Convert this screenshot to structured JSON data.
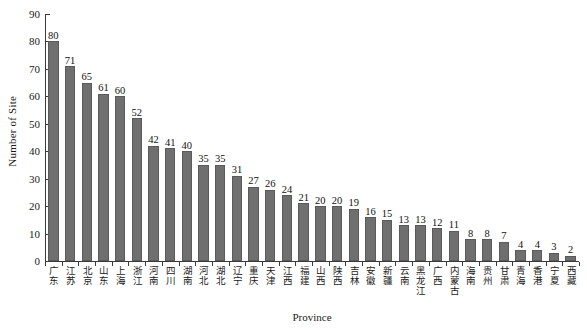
{
  "chart_data": {
    "type": "bar",
    "title": "",
    "xlabel": "Province",
    "ylabel": "Number of Site",
    "ylim": [
      0,
      90
    ],
    "ytick_step": 10,
    "yticks": [
      0,
      10,
      20,
      30,
      40,
      50,
      60,
      70,
      80,
      90
    ],
    "grid": false,
    "legend": null,
    "bar_color": "#6f6f6f",
    "bar_edge_color": "#5a5a5a",
    "axis_color": "#3a3a3a",
    "value_labels_shown": true,
    "categories": [
      "广东",
      "江苏",
      "北京",
      "山东",
      "上海",
      "浙江",
      "河南",
      "四川",
      "湖南",
      "河北",
      "湖北",
      "辽宁",
      "重庆",
      "天津",
      "江西",
      "福建",
      "山西",
      "陕西",
      "吉林",
      "安徽",
      "新疆",
      "云南",
      "黑龙江",
      "广西",
      "内蒙古",
      "海南",
      "贵州",
      "甘肃",
      "青海",
      "香港",
      "宁夏",
      "西藏"
    ],
    "values": [
      80,
      71,
      65,
      61,
      60,
      52,
      42,
      41,
      40,
      35,
      35,
      31,
      27,
      26,
      24,
      21,
      20,
      20,
      19,
      16,
      15,
      13,
      13,
      12,
      11,
      8,
      8,
      7,
      4,
      4,
      3,
      2
    ]
  }
}
